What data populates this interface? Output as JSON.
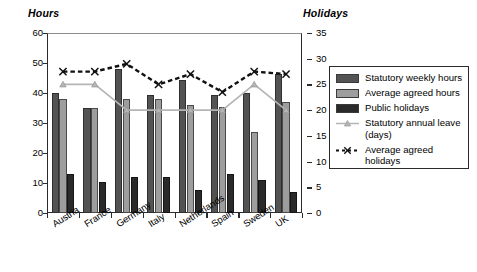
{
  "chart_data": {
    "type": "bar",
    "title": "",
    "categories": [
      "Austria",
      "France",
      "Germany",
      "Italy",
      "Netherlands",
      "Spain",
      "Sweden",
      "UK"
    ],
    "ylabel": "Hours",
    "y2label": "Holidays",
    "xlabel": "",
    "ylim": [
      0,
      60
    ],
    "y2lim": [
      0,
      35
    ],
    "yticks": [
      0,
      10,
      20,
      30,
      40,
      50,
      60
    ],
    "y2ticks": [
      0,
      5,
      10,
      15,
      20,
      25,
      30,
      35
    ],
    "grid": false,
    "legend_position": "right",
    "series": [
      {
        "name": "Statutory weekly hours",
        "kind": "bar",
        "axis": "left",
        "color": "#535353",
        "values": [
          40,
          35,
          48,
          39.5,
          44.5,
          39.5,
          40,
          46.5
        ]
      },
      {
        "name": "Average agreed hours",
        "kind": "bar",
        "axis": "left",
        "color": "#9d9d9d",
        "values": [
          38,
          35,
          38,
          38,
          36,
          35.5,
          27,
          37
        ]
      },
      {
        "name": "Public holidays",
        "kind": "bar",
        "axis": "right",
        "color": "#2a2a2a",
        "values": [
          7.5,
          6,
          7,
          7,
          4.5,
          7.5,
          6.5,
          4
        ]
      },
      {
        "name": "Statutory annual leave (days)",
        "kind": "line",
        "axis": "right",
        "color": "#b5b5b5",
        "marker": "triangle",
        "dash": "solid",
        "values": [
          25,
          25,
          20,
          20,
          20,
          20,
          25,
          20
        ]
      },
      {
        "name": "Average agreed holidays",
        "kind": "line",
        "axis": "right",
        "color": "#111111",
        "marker": "x",
        "dash": "dashed",
        "values": [
          27.5,
          27.5,
          29,
          25,
          27,
          23.5,
          27.5,
          27
        ]
      }
    ]
  },
  "axes": {
    "left_title": "Hours",
    "right_title": "Holidays"
  },
  "legend": {
    "items": [
      {
        "label": "Statutory weekly hours",
        "type": "swatch",
        "color": "#535353"
      },
      {
        "label": "Average agreed hours",
        "type": "swatch",
        "color": "#9d9d9d"
      },
      {
        "label": "Public holidays",
        "type": "swatch",
        "color": "#2a2a2a"
      },
      {
        "label": "Statutory annual leave (days)",
        "type": "line-triangle",
        "color": "#b5b5b5"
      },
      {
        "label": "Average agreed holidays",
        "type": "line-dashed-x",
        "color": "#111111"
      }
    ]
  }
}
